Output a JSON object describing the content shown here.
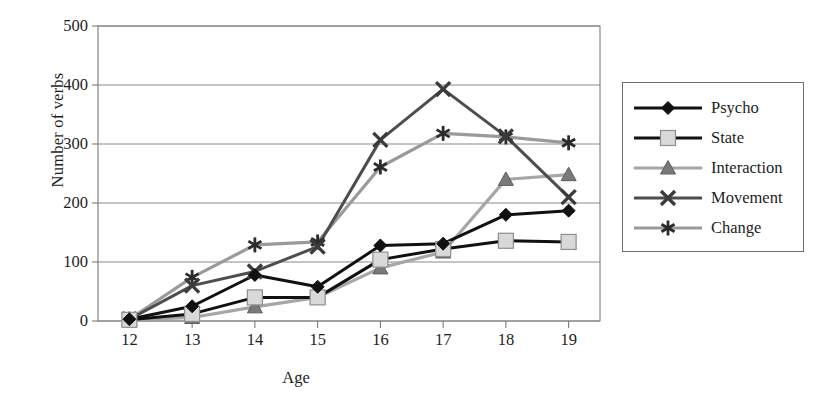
{
  "chart_data": {
    "type": "line",
    "title": "",
    "xlabel": "Age",
    "ylabel": "Number of verbs",
    "categories": [
      "12",
      "13",
      "14",
      "15",
      "16",
      "17",
      "18",
      "19"
    ],
    "x": [
      12,
      13,
      14,
      15,
      16,
      17,
      18,
      19
    ],
    "xlim": [
      11.5,
      19.5
    ],
    "ylim": [
      0,
      500
    ],
    "yticks": [
      "0",
      "100",
      "200",
      "300",
      "400",
      "500"
    ],
    "ytick_values": [
      0,
      100,
      200,
      300,
      400,
      500
    ],
    "grid": "horizontal",
    "legend_position": "right-outside",
    "series": [
      {
        "name": "Psycho",
        "marker": "diamond",
        "color": "#111111",
        "line_color": "#111111",
        "values": [
          3,
          25,
          78,
          58,
          128,
          131,
          180,
          187
        ]
      },
      {
        "name": "State",
        "marker": "square",
        "color": "#d9d9d9",
        "line_color": "#111111",
        "values": [
          2,
          12,
          40,
          40,
          104,
          122,
          136,
          134
        ]
      },
      {
        "name": "Interaction",
        "marker": "triangle",
        "color": "#7a7a7a",
        "line_color": "#a6a6a6",
        "values": [
          2,
          6,
          24,
          40,
          90,
          117,
          240,
          248
        ]
      },
      {
        "name": "Movement",
        "marker": "cross",
        "color": "#3b3b3b",
        "line_color": "#4d4d4d",
        "values": [
          3,
          60,
          84,
          126,
          307,
          393,
          313,
          210
        ]
      },
      {
        "name": "Change",
        "marker": "asterisk",
        "color": "#2b2b2b",
        "line_color": "#9a9a9a",
        "values": [
          3,
          74,
          129,
          134,
          261,
          318,
          312,
          302
        ]
      }
    ]
  },
  "axis": {
    "ylabel": "Number of verbs",
    "xlabel": "Age"
  },
  "legend": {
    "items": [
      {
        "label": "Psycho"
      },
      {
        "label": "State"
      },
      {
        "label": "Interaction"
      },
      {
        "label": "Movement"
      },
      {
        "label": "Change"
      }
    ]
  }
}
